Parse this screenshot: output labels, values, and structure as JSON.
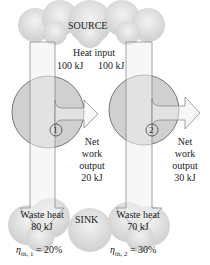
{
  "source": {
    "label": "SOURCE"
  },
  "heat_input": {
    "label": "Heat input",
    "engine1": "100 kJ",
    "engine2": "100 kJ"
  },
  "engine1": {
    "id": "1",
    "work_label_1": "Net",
    "work_label_2": "work",
    "work_label_3": "output",
    "work_value": "20 kJ",
    "waste_label": "Waste heat",
    "waste_value": "80 kJ",
    "efficiency": "η",
    "efficiency_sub": "th, 1",
    "efficiency_value": "= 20%"
  },
  "engine2": {
    "id": "2",
    "work_label_1": "Net",
    "work_label_2": "work",
    "work_label_3": "output",
    "work_value": "30 kJ",
    "waste_label": "Waste heat",
    "waste_value": "70 kJ",
    "efficiency": "η",
    "efficiency_sub": "th, 2",
    "efficiency_value": "= 30%"
  },
  "sink": {
    "label": "SINK"
  },
  "colors": {
    "cloud": "#d9d9d9",
    "engine": "#cfcfcf",
    "arrow_fill": "#ebebeb",
    "arrow_stroke": "#8a8a8a"
  }
}
